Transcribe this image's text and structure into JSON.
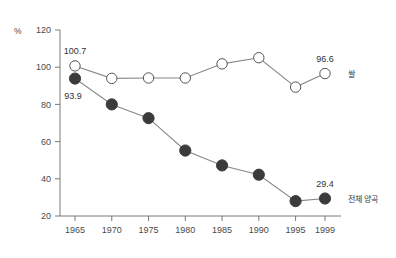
{
  "chart_data": {
    "type": "line",
    "title": "",
    "subtitle": "",
    "xlabel": "",
    "ylabel": "",
    "unit_label": "%",
    "categories": [
      "1965",
      "1970",
      "1975",
      "1980",
      "1985",
      "1990",
      "1995",
      "1999"
    ],
    "x_tick_labels": [
      "1965",
      "1970",
      "1975",
      "1980",
      "1985",
      "1990",
      "1995",
      "1999"
    ],
    "y_tick_labels": [
      "20",
      "40",
      "60",
      "80",
      "100",
      "120"
    ],
    "y_ticks": [
      20,
      40,
      60,
      80,
      100,
      120
    ],
    "ylim": [
      20,
      120
    ],
    "grid": false,
    "legend_position": "right-inline",
    "series": [
      {
        "name": "쌀",
        "marker": "open-circle",
        "color": "#ffffff",
        "edge_color": "#555555",
        "line_color": "#888888",
        "values": [
          100.7,
          94.0,
          94.2,
          94.2,
          101.8,
          105.1,
          89.3,
          96.6
        ],
        "annotations": [
          {
            "index": 0,
            "text": "100.7"
          },
          {
            "index": 7,
            "text": "96.6"
          }
        ]
      },
      {
        "name": "전체 양곡",
        "marker": "filled-circle",
        "color": "#3b3b3b",
        "edge_color": "#3b3b3b",
        "line_color": "#888888",
        "values": [
          93.9,
          80.0,
          72.6,
          55.2,
          47.2,
          42.2,
          28.0,
          29.4
        ],
        "annotations": [
          {
            "index": 0,
            "text": "93.9"
          },
          {
            "index": 7,
            "text": "29.4"
          }
        ]
      }
    ],
    "colors": {
      "axis": "#6b6b6b",
      "line": "#8a8a8a",
      "filled_marker": "#3b3b3b",
      "open_marker_fill": "#ffffff",
      "open_marker_edge": "#555555",
      "text": "#4a4a4a",
      "background": "#ffffff"
    }
  }
}
